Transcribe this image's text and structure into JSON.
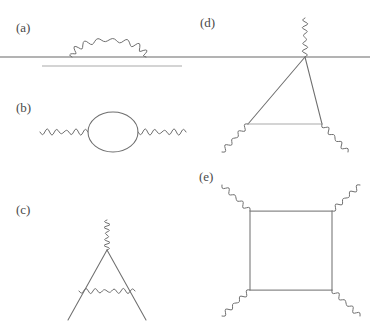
{
  "figure": {
    "background_color": "#ffffff",
    "width": 370,
    "height": 323,
    "line_color": "#6f6f6f",
    "external_line_color": "#9a9a9a",
    "label_color": "#4a4a4a"
  },
  "panels": [
    {
      "id": "a",
      "label": "(a)",
      "label_x": 16,
      "label_y": 32,
      "description": "electron self-energy on a horizontal fermion line with photon arch",
      "elements": {
        "main_line_y": 57,
        "main_line_x1": 0,
        "main_line_x2": 370,
        "lower_line_y": 66,
        "lower_line_x1": 42,
        "lower_line_x2": 182,
        "arch_x1": 72,
        "arch_x2": 146,
        "arch_peak_y": 40,
        "arch_waves": 8
      }
    },
    {
      "id": "b",
      "label": "(b)",
      "label_x": 16,
      "label_y": 112,
      "description": "photon self-energy / vacuum polarization bubble",
      "elements": {
        "left_wave_x1": 40,
        "left_wave_x2": 88,
        "right_wave_x1": 138,
        "right_wave_x2": 186,
        "wave_y": 132,
        "loop_cx": 113,
        "loop_cy": 132,
        "loop_rx": 25,
        "loop_ry": 20,
        "left_waves": 5,
        "right_waves": 5
      }
    },
    {
      "id": "c",
      "label": "(c)",
      "label_x": 16,
      "label_y": 214,
      "description": "vertex correction with incoming photon and exchanged photon",
      "elements": {
        "apex_x": 107,
        "apex_y": 250,
        "photon_top_y": 220,
        "photon_waves": 5,
        "left_leg_x": 68,
        "left_leg_y": 320,
        "right_leg_x": 146,
        "right_leg_y": 320,
        "rung_y": 291,
        "rung_x1": 79,
        "rung_x2": 135,
        "rung_waves": 6
      }
    },
    {
      "id": "d",
      "label": "(d)",
      "label_x": 200,
      "label_y": 27,
      "description": "triangle vertex diagram attached to the horizontal line with three photon legs",
      "elements": {
        "apex_x": 305,
        "apex_y": 57,
        "photon_top_y": 18,
        "photon_top_waves": 5,
        "base_y": 124,
        "base_x1": 248,
        "base_x2": 322,
        "left_tail_x": 222,
        "left_tail_y": 152,
        "right_tail_x": 348,
        "right_tail_y": 152,
        "tail_waves": 4
      }
    },
    {
      "id": "e",
      "label": "(e)",
      "label_x": 199,
      "label_y": 181,
      "description": "light-by-light box diagram with four external photon legs",
      "elements": {
        "box_left": 250,
        "box_right": 332,
        "box_top": 211,
        "box_bottom": 290,
        "leg_dx": 28,
        "leg_dy": 26,
        "leg_waves": 4
      }
    }
  ]
}
